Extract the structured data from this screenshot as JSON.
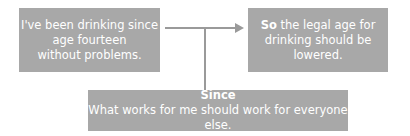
{
  "diagram": {
    "type": "argument-map",
    "colors": {
      "box_fill": "#a8a8a8",
      "text": "#ffffff",
      "connector": "#9a9a9a"
    },
    "reason": {
      "lines": [
        "I've been drinking since",
        "age fourteen",
        "without problems."
      ]
    },
    "conclusion": {
      "keyword": "So",
      "lines": [
        " the legal age for",
        "drinking should be",
        "lowered."
      ]
    },
    "warrant": {
      "keyword": "Since",
      "text": "What works for me should work for everyone else."
    }
  }
}
